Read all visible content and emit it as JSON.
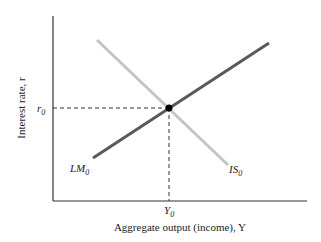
{
  "diagram": {
    "type": "IS-LM equilibrium",
    "y_axis_label": "Interest rate, r",
    "x_axis_label": "Aggregate output (income), Y",
    "equilibrium": {
      "r_label": "r",
      "r_sub": "0",
      "y_label": "Y",
      "y_sub": "0"
    },
    "curves": [
      {
        "name": "LM",
        "sub": "0",
        "color": "#5a5a5a",
        "slope": "upward"
      },
      {
        "name": "IS",
        "sub": "0",
        "color": "#c4c4c4",
        "slope": "downward"
      }
    ]
  }
}
